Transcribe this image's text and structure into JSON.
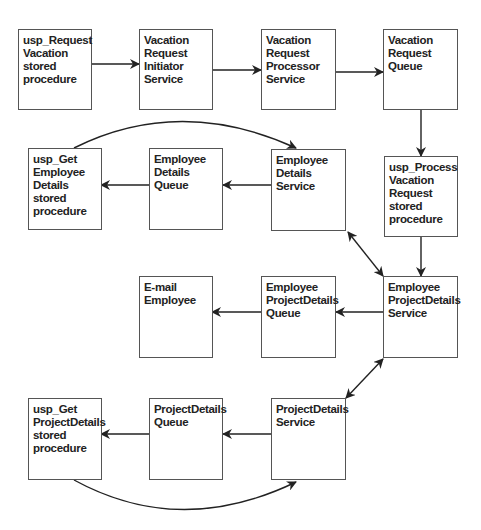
{
  "diagram": {
    "nodes": [
      {
        "id": "usp_request_vacation",
        "label": "usp_Request\nVacation\nstored\nprocedure"
      },
      {
        "id": "vacation_request_initiator",
        "label": "Vacation\nRequest\nInitiator\nService"
      },
      {
        "id": "vacation_request_processor",
        "label": "Vacation\nRequest\nProcessor\nService"
      },
      {
        "id": "vacation_request_queue",
        "label": "Vacation\nRequest Queue"
      },
      {
        "id": "usp_get_employee_details",
        "label": "usp_Get\nEmployee\nDetails stored\nprocedure"
      },
      {
        "id": "employee_details_queue",
        "label": "Employee\nDetails Queue"
      },
      {
        "id": "employee_details_service",
        "label": "Employee\nDetails\nService"
      },
      {
        "id": "usp_process_vacation_request",
        "label": "usp_Process\nVacation\nRequest\nstored\nprocedure"
      },
      {
        "id": "email_employee",
        "label": "E-mail\nEmployee"
      },
      {
        "id": "employee_projectdetails_queue",
        "label": "Employee\nProjectDetails\nQueue"
      },
      {
        "id": "employee_projectdetails_service",
        "label": "Employee\nProjectDetails\nService"
      },
      {
        "id": "usp_get_projectdetails",
        "label": "usp_Get\nProjectDetails\nstored\nprocedure"
      },
      {
        "id": "projectdetails_queue",
        "label": "ProjectDetails\nQueue"
      },
      {
        "id": "projectdetails_service",
        "label": "ProjectDetails\nService"
      }
    ],
    "edges": [
      {
        "from": "usp_request_vacation",
        "to": "vacation_request_initiator"
      },
      {
        "from": "vacation_request_initiator",
        "to": "vacation_request_processor"
      },
      {
        "from": "vacation_request_processor",
        "to": "vacation_request_queue"
      },
      {
        "from": "vacation_request_queue",
        "to": "usp_process_vacation_request"
      },
      {
        "from": "usp_process_vacation_request",
        "to": "employee_projectdetails_service"
      },
      {
        "from": "employee_projectdetails_service",
        "to": "employee_details_service",
        "bidirectional": true
      },
      {
        "from": "employee_details_service",
        "to": "employee_details_queue"
      },
      {
        "from": "employee_details_queue",
        "to": "usp_get_employee_details"
      },
      {
        "from": "usp_get_employee_details",
        "to": "employee_details_service",
        "curved": true
      },
      {
        "from": "employee_projectdetails_service",
        "to": "employee_projectdetails_queue"
      },
      {
        "from": "employee_projectdetails_queue",
        "to": "email_employee"
      },
      {
        "from": "employee_projectdetails_service",
        "to": "projectdetails_service",
        "bidirectional": true
      },
      {
        "from": "projectdetails_service",
        "to": "projectdetails_queue"
      },
      {
        "from": "projectdetails_queue",
        "to": "usp_get_projectdetails"
      },
      {
        "from": "usp_get_projectdetails",
        "to": "projectdetails_service",
        "curved": true
      }
    ]
  }
}
